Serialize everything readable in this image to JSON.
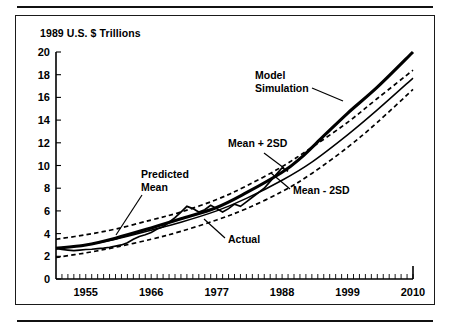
{
  "figure": {
    "title": "1989 U.S. $ Trillions",
    "top_rule": true,
    "bottom_rule": true
  },
  "chart_data": {
    "type": "line",
    "title": "1989 U.S. $ Trillions",
    "xlabel": "",
    "ylabel": "1989 U.S. $ Trillions",
    "xlim": [
      1950,
      2010
    ],
    "ylim": [
      0,
      20
    ],
    "grid": false,
    "legend": "annotations-with-leader-lines",
    "y_ticks": [
      0,
      2,
      4,
      6,
      8,
      10,
      12,
      14,
      16,
      18,
      20
    ],
    "y_tick_labels": [
      "0",
      "2",
      "4",
      "6",
      "8",
      "10",
      "12",
      "14",
      "16",
      "18",
      "20"
    ],
    "x_ticks": [
      1955,
      1966,
      1977,
      1988,
      1999,
      2010
    ],
    "x_tick_labels": [
      "1955",
      "1966",
      "1977",
      "1988",
      "1999",
      "2010"
    ],
    "x_minor_tick_interval": 1,
    "annotations": [
      {
        "text": "Model Simulation",
        "line1": "Model",
        "line2": "Simulation"
      },
      {
        "text": "Mean + 2SD",
        "line1": "Mean + 2SD",
        "line2": ""
      },
      {
        "text": "Mean - 2SD",
        "line1": "Mean - 2SD",
        "line2": ""
      },
      {
        "text": "Predicted Mean",
        "line1": "Predicted",
        "line2": "Mean"
      },
      {
        "text": "Actual",
        "line1": "Actual",
        "line2": ""
      }
    ],
    "series": [
      {
        "name": "Mean + 2SD",
        "style": "dashed",
        "x": [
          1950,
          1955,
          1960,
          1966,
          1971,
          1977,
          1982,
          1988,
          1993,
          1999,
          2004,
          2010
        ],
        "values": [
          3.5,
          3.9,
          4.4,
          5.2,
          5.9,
          7.0,
          8.2,
          9.9,
          11.6,
          13.8,
          15.9,
          18.4
        ]
      },
      {
        "name": "Predicted Mean",
        "style": "solid-thin",
        "x": [
          1950,
          1955,
          1960,
          1966,
          1971,
          1977,
          1982,
          1988,
          1993,
          1999,
          2004,
          2010
        ],
        "values": [
          2.7,
          3.0,
          3.5,
          4.3,
          5.0,
          6.0,
          7.1,
          8.7,
          10.3,
          12.7,
          14.9,
          17.7
        ]
      },
      {
        "name": "Mean - 2SD",
        "style": "dashed",
        "x": [
          1950,
          1955,
          1960,
          1966,
          1971,
          1977,
          1982,
          1988,
          1993,
          1999,
          2004,
          2010
        ],
        "values": [
          1.9,
          2.3,
          2.8,
          3.5,
          4.2,
          5.2,
          6.2,
          7.7,
          9.3,
          11.6,
          13.8,
          16.7
        ]
      },
      {
        "name": "Model Simulation",
        "style": "solid-thick",
        "x": [
          1950,
          1955,
          1960,
          1966,
          1971,
          1977,
          1982,
          1988,
          1991,
          1995,
          1999,
          2004,
          2010
        ],
        "values": [
          2.7,
          3.0,
          3.6,
          4.5,
          5.3,
          6.3,
          7.6,
          9.4,
          10.6,
          12.6,
          14.6,
          16.9,
          20.0
        ]
      },
      {
        "name": "Actual",
        "style": "jagged",
        "x": [
          1950,
          1951,
          1952,
          1953,
          1954,
          1955,
          1956,
          1957,
          1958,
          1959,
          1960,
          1961,
          1962,
          1963,
          1964,
          1965,
          1966,
          1967,
          1968,
          1969,
          1970,
          1971,
          1972,
          1973,
          1974,
          1975,
          1976,
          1977,
          1978,
          1979,
          1980,
          1981,
          1982,
          1983,
          1984,
          1985,
          1986,
          1987,
          1988,
          1989
        ],
        "values": [
          2.7,
          2.6,
          2.55,
          2.5,
          2.55,
          2.6,
          2.62,
          2.68,
          2.72,
          2.8,
          2.9,
          3.0,
          3.2,
          3.5,
          3.75,
          3.9,
          4.1,
          4.4,
          4.6,
          5.0,
          5.4,
          5.9,
          6.4,
          6.2,
          5.9,
          6.1,
          6.5,
          6.2,
          5.9,
          6.2,
          6.6,
          6.4,
          6.8,
          7.2,
          7.6,
          8.0,
          8.6,
          9.2,
          9.8,
          9.5
        ]
      }
    ]
  }
}
